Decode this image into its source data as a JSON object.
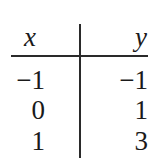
{
  "table": {
    "headers": [
      "x",
      "y"
    ],
    "rows": [
      {
        "x": "−1",
        "y": "−1"
      },
      {
        "x": "0",
        "y": "1"
      },
      {
        "x": "1",
        "y": "3"
      }
    ]
  }
}
